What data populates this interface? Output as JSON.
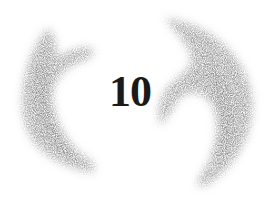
{
  "chapter": {
    "number": "10"
  },
  "decoration": {
    "left_stroke": "brush-crescent-left",
    "right_stroke": "brush-crescent-right",
    "stroke_color": "#8a8a8a",
    "text_color": "#1a1a1a",
    "background": "#ffffff"
  }
}
